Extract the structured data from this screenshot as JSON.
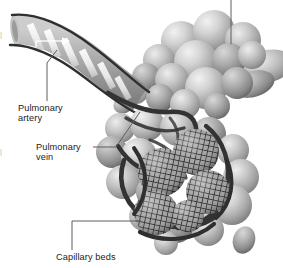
{
  "figure": {
    "background_color": "#ffffff",
    "ink_color": "#1b1b1b",
    "sphere_light": "#e8e8e8",
    "sphere_mid": "#b4b4b4",
    "sphere_dark": "#8a8a8a",
    "vessel_color": "#3a3a3a",
    "mesh_color": "#2e2e2e",
    "leader_color": "#6e6e6e",
    "width": 283,
    "height": 268
  },
  "labels": {
    "artery": "Pulmonary\nartery",
    "vein": "Pulmonary\nvein",
    "capillary": "Capillary beds",
    "edge_fragment_top": "|",
    "edge_fragment_mid": "|"
  },
  "annotations": {
    "flow_arrow": "flow-arrow",
    "top_leader": "leader-line-top-cropped"
  }
}
